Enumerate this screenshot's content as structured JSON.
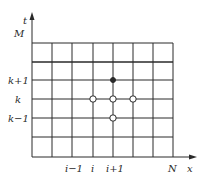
{
  "diagram": {
    "type": "finite-difference-grid",
    "axes": {
      "x_label": "x",
      "y_label": "t",
      "x_end_label": "N",
      "y_end_label": "M"
    },
    "row_labels": [
      {
        "text": "k+1",
        "row": 1
      },
      {
        "text": "k",
        "row": 2
      },
      {
        "text": "k−1",
        "row": 3
      }
    ],
    "col_labels": [
      {
        "text": "i−1",
        "col": 2
      },
      {
        "text": "i",
        "col": 3
      },
      {
        "text": "i+1",
        "col": 4
      }
    ],
    "grid": {
      "x_lines": [
        32,
        52,
        72,
        93,
        113,
        133,
        153,
        173
      ],
      "y_lines": [
        43,
        62,
        80,
        99,
        118,
        137,
        157
      ]
    },
    "nodes": [
      {
        "name": "node-i-k-plus-1",
        "col": 3,
        "row": 1,
        "style": "filled"
      },
      {
        "name": "node-i-minus-1-k",
        "col": 2,
        "row": 2,
        "style": "open"
      },
      {
        "name": "node-i-k",
        "col": 3,
        "row": 2,
        "style": "open"
      },
      {
        "name": "node-i-plus-1-k",
        "col": 4,
        "row": 2,
        "style": "open"
      },
      {
        "name": "node-i-k-minus-1",
        "col": 3,
        "row": 3,
        "style": "open"
      }
    ],
    "colors": {
      "line": "#2a2a2a",
      "background": "#ffffff"
    }
  }
}
